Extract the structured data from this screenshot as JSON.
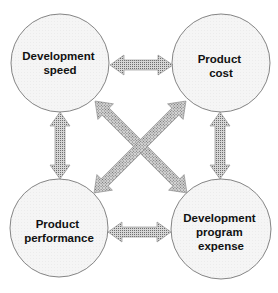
{
  "diagram": {
    "type": "relationship-diagram",
    "colors": {
      "background": "#ffffff",
      "node_fill": "#f3f3f3",
      "node_stroke": "#777777",
      "arrow_fill": "#a8a8a8",
      "arrow_stroke": "#888888",
      "text": "#111111"
    },
    "nodes": [
      {
        "id": "development-speed",
        "lines": [
          "Development",
          "speed"
        ],
        "cx": 60,
        "cy": 63,
        "r": 49
      },
      {
        "id": "product-cost",
        "lines": [
          "Product",
          "cost"
        ],
        "cx": 221,
        "cy": 63,
        "r": 49
      },
      {
        "id": "product-performance",
        "lines": [
          "Product",
          "performance"
        ],
        "cx": 59,
        "cy": 228,
        "r": 49
      },
      {
        "id": "development-program-expense",
        "lines": [
          "Development",
          "program",
          "expense"
        ],
        "cx": 221,
        "cy": 229,
        "r": 50
      }
    ],
    "edges": [
      {
        "from": "development-speed",
        "to": "product-cost",
        "direction": "bidirectional"
      },
      {
        "from": "development-speed",
        "to": "product-performance",
        "direction": "bidirectional"
      },
      {
        "from": "product-cost",
        "to": "development-program-expense",
        "direction": "bidirectional"
      },
      {
        "from": "product-performance",
        "to": "development-program-expense",
        "direction": "bidirectional"
      },
      {
        "from": "development-speed",
        "to": "development-program-expense",
        "direction": "bidirectional"
      },
      {
        "from": "product-cost",
        "to": "product-performance",
        "direction": "bidirectional"
      }
    ]
  }
}
